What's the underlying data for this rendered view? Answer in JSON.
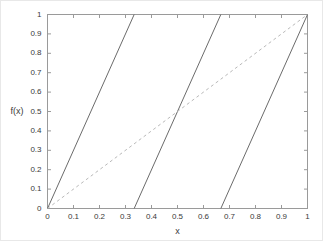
{
  "figure": {
    "background_color": "#ffffff",
    "frame_color": "#9a9a9a",
    "border_color": "#e8e8e8"
  },
  "axis": {
    "xlabel": "x",
    "ylabel": "f(x)",
    "x_ticks": [
      "0",
      "0.1",
      "0.2",
      "0.3",
      "0.4",
      "0.5",
      "0.6",
      "0.7",
      "0.8",
      "0.9",
      "1"
    ],
    "y_ticks": [
      "0",
      "0.1",
      "0.2",
      "0.3",
      "0.4",
      "0.5",
      "0.6",
      "0.7",
      "0.8",
      "0.9",
      "1"
    ]
  },
  "chart_data": {
    "type": "line",
    "title": "",
    "xlabel": "x",
    "ylabel": "f(x)",
    "xlim": [
      0,
      1
    ],
    "ylim": [
      0,
      1
    ],
    "xticks": [
      0,
      0.1,
      0.2,
      0.3,
      0.4,
      0.5,
      0.6,
      0.7,
      0.8,
      0.9,
      1
    ],
    "yticks": [
      0,
      0.1,
      0.2,
      0.3,
      0.4,
      0.5,
      0.6,
      0.7,
      0.8,
      0.9,
      1
    ],
    "grid": false,
    "legend": null,
    "series": [
      {
        "name": "sawtooth-branch-1",
        "style": "solid",
        "color": "#6b6b6b",
        "width": 1,
        "x": [
          0,
          0.3333
        ],
        "y": [
          0,
          1
        ]
      },
      {
        "name": "sawtooth-branch-2",
        "style": "solid",
        "color": "#6b6b6b",
        "width": 1,
        "x": [
          0.3333,
          0.6667
        ],
        "y": [
          0,
          1
        ]
      },
      {
        "name": "sawtooth-branch-3",
        "style": "solid",
        "color": "#6b6b6b",
        "width": 1,
        "x": [
          0.6667,
          1
        ],
        "y": [
          0,
          1
        ]
      },
      {
        "name": "identity-line",
        "style": "dashed",
        "color": "#b9b9b9",
        "width": 1,
        "x": [
          0,
          1
        ],
        "y": [
          0,
          1
        ]
      }
    ]
  }
}
